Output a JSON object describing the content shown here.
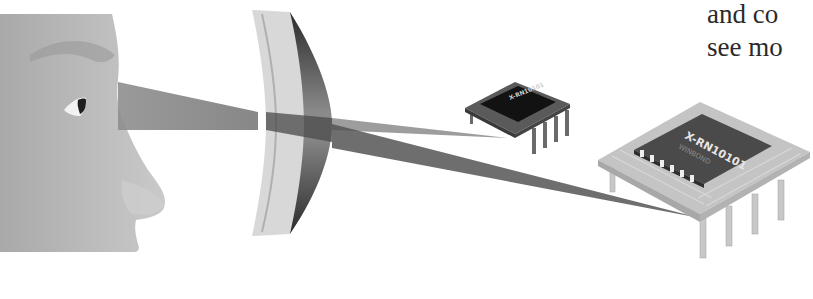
{
  "caption": {
    "line1": "and co",
    "line2": "see mo"
  },
  "figure": {
    "lens": "concave-convex lens",
    "small_chip": {
      "label": "X-RN10101"
    },
    "large_chip": {
      "label": "X-RN10101",
      "sublabel": "WINBOND"
    }
  },
  "colors": {
    "background": "#ffffff",
    "skin": "#b8b8b8",
    "beam": "#8a8a8a",
    "beam_dark": "#4a4a4a",
    "chip_dark": "#1a1a1a",
    "chip_light": "#c4c4c4",
    "text": "#2a2a2a"
  }
}
